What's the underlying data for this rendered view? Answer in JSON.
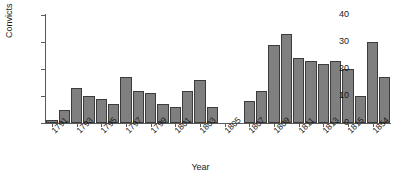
{
  "chart_data": {
    "type": "bar",
    "title": "",
    "xlabel": "Year",
    "ylabel": "Convicts",
    "ylim": [
      0,
      40
    ],
    "yticks": [
      0,
      10,
      20,
      30,
      40
    ],
    "grid": false,
    "legend": null,
    "categories": [
      "1791",
      "1792",
      "1793",
      "1794",
      "1795",
      "1796",
      "1797",
      "1798",
      "1799",
      "1800",
      "1801",
      "1802",
      "1803",
      "1804",
      "1805",
      "1806",
      "1807",
      "1808",
      "1809",
      "1810",
      "1811",
      "1812",
      "1813",
      "1814",
      "1815",
      "1816",
      "1854",
      "1855"
    ],
    "values": [
      1,
      5,
      13,
      10,
      9,
      7,
      17,
      12,
      11,
      7,
      6,
      12,
      16,
      6,
      0,
      0,
      8,
      12,
      29,
      33,
      24,
      23,
      22,
      23,
      20,
      10,
      30,
      17
    ],
    "xtick_labels": [
      "1791",
      "1793",
      "1795",
      "1797",
      "1799",
      "1801",
      "1803",
      "1805",
      "1807",
      "1809",
      "1811",
      "1813",
      "1815",
      "1854"
    ],
    "xtick_categories": [
      "1791",
      "1793",
      "1795",
      "1797",
      "1799",
      "1801",
      "1803",
      "1805",
      "1807",
      "1809",
      "1811",
      "1813",
      "1815",
      "1854"
    ],
    "note_gap": "no bars plotted for 1805 and 1806"
  },
  "colors": {
    "bar_fill": "#7f7f7f",
    "bar_stroke": "#3c3c3c",
    "axis": "#5a5a5a",
    "text": "#1a1a1a",
    "background": "#ffffff"
  }
}
